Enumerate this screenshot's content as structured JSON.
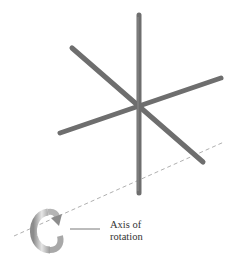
{
  "figure": {
    "label": {
      "line1": "Axis of",
      "line2": "rotation"
    },
    "colors": {
      "rod": "#6e6e6e",
      "rod_highlight": "#8a8a8a",
      "axis_line": "#9a9a9a",
      "arrow_light": "#e0e0e0",
      "arrow_dark": "#8c8c8c",
      "text": "#333333",
      "background": "#ffffff"
    },
    "rods": [
      {
        "name": "vertical-rod",
        "x1": 139,
        "y1": 15,
        "x2": 139,
        "y2": 193
      },
      {
        "name": "diagonal-rod-a",
        "x1": 72,
        "y1": 48,
        "x2": 203,
        "y2": 162
      },
      {
        "name": "diagonal-rod-b",
        "x1": 60,
        "y1": 133,
        "x2": 221,
        "y2": 78
      }
    ],
    "axis": {
      "x1": 14,
      "y1": 236,
      "x2": 224,
      "y2": 142
    },
    "icons": [
      "rotation-arrow-icon"
    ]
  }
}
